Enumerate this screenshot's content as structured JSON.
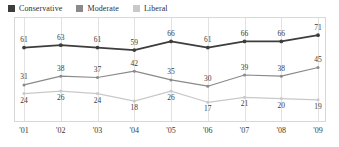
{
  "legend": {
    "items": [
      {
        "label": "Conservative",
        "color": "#3d3d3d",
        "icon": "legend-swatch-icon"
      },
      {
        "label": "Moderate",
        "color": "#8a8a8a",
        "icon": "legend-swatch-icon"
      },
      {
        "label": "Liberal",
        "color": "#c9c9c9",
        "icon": "legend-swatch-icon"
      }
    ]
  },
  "axis": {
    "x_ticks": [
      "'01",
      "'02",
      "'03",
      "'04",
      "'05",
      "'06",
      "'07",
      "'08",
      "'09"
    ]
  },
  "chart_data": {
    "type": "line",
    "title": "",
    "xlabel": "",
    "ylabel": "",
    "grid": "vertical",
    "legend_position": "top-left",
    "ylim": [
      10,
      76
    ],
    "categories": [
      "'01",
      "'02",
      "'03",
      "'04",
      "'05",
      "'06",
      "'07",
      "'08",
      "'09"
    ],
    "series": [
      {
        "name": "Conservative",
        "color": "#3d3d3d",
        "values": [
          61,
          63,
          61,
          59,
          66,
          61,
          66,
          66,
          71
        ],
        "label_positions": [
          "above",
          "above",
          "above",
          "above",
          "above",
          "above",
          "above",
          "above",
          "above"
        ]
      },
      {
        "name": "Moderate",
        "color": "#8a8a8a",
        "values": [
          31,
          38,
          37,
          42,
          35,
          30,
          39,
          38,
          45
        ],
        "label_positions": [
          "above",
          "above",
          "above",
          "above",
          "above",
          "above",
          "above",
          "above",
          "above"
        ]
      },
      {
        "name": "Liberal",
        "color": "#c9c9c9",
        "values": [
          24,
          26,
          24,
          18,
          26,
          17,
          21,
          20,
          19
        ],
        "label_positions": [
          "below",
          "below",
          "below",
          "below",
          "below",
          "below",
          "below",
          "below",
          "below"
        ]
      }
    ]
  }
}
